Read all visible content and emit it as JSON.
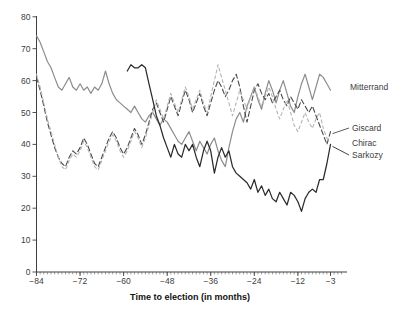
{
  "figure": {
    "background": "#ffffff"
  },
  "chart_data": {
    "type": "line",
    "title": "",
    "xlabel": "Time to election (in months)",
    "ylabel": "",
    "xlim": [
      -84,
      0
    ],
    "ylim": [
      0,
      80
    ],
    "xticks": [
      -84,
      -72,
      -60,
      -48,
      -36,
      -24,
      -12,
      -3
    ],
    "yticks": [
      0,
      10,
      20,
      30,
      40,
      50,
      60,
      70,
      80
    ],
    "minor_xtick_every_months": 1,
    "grid": false,
    "legend_position": "right-end-labels",
    "axis_color": "#3f3f3f",
    "series": [
      {
        "name": "Mitterrand",
        "style": "solid",
        "color": "#8c8c8c",
        "width": 1.2,
        "dash": "",
        "label": {
          "x": 350,
          "y": 90,
          "connector": false
        },
        "points": [
          [
            -84,
            74
          ],
          [
            -83,
            72
          ],
          [
            -82,
            69
          ],
          [
            -81,
            66
          ],
          [
            -80,
            64
          ],
          [
            -79,
            61
          ],
          [
            -78,
            58
          ],
          [
            -77,
            57
          ],
          [
            -76,
            59
          ],
          [
            -75,
            61
          ],
          [
            -74,
            58
          ],
          [
            -73,
            57
          ],
          [
            -72,
            59
          ],
          [
            -71,
            57
          ],
          [
            -70,
            58
          ],
          [
            -69,
            56
          ],
          [
            -68,
            58
          ],
          [
            -67,
            57
          ],
          [
            -66,
            59
          ],
          [
            -65,
            63
          ],
          [
            -64,
            59
          ],
          [
            -63,
            56
          ],
          [
            -62,
            54
          ],
          [
            -61,
            53
          ],
          [
            -60,
            52
          ],
          [
            -59,
            51
          ],
          [
            -58,
            50
          ],
          [
            -57,
            52
          ],
          [
            -56,
            50
          ],
          [
            -55,
            48
          ],
          [
            -54,
            47
          ],
          [
            -53,
            49
          ],
          [
            -52,
            50
          ],
          [
            -51,
            48
          ],
          [
            -50,
            46
          ],
          [
            -49,
            48
          ],
          [
            -48,
            47
          ],
          [
            -47,
            45
          ],
          [
            -46,
            43
          ],
          [
            -45,
            41
          ],
          [
            -44,
            40
          ],
          [
            -43,
            42
          ],
          [
            -42,
            44
          ],
          [
            -41,
            41
          ],
          [
            -40,
            38
          ],
          [
            -39,
            41
          ],
          [
            -38,
            39
          ],
          [
            -37,
            37
          ],
          [
            -36,
            40
          ],
          [
            -35,
            42
          ],
          [
            -34,
            38
          ],
          [
            -33,
            35
          ],
          [
            -32,
            33
          ],
          [
            -31,
            39
          ],
          [
            -30,
            44
          ],
          [
            -29,
            48
          ],
          [
            -28,
            50
          ],
          [
            -27,
            47
          ],
          [
            -26,
            52
          ],
          [
            -25,
            55
          ],
          [
            -24,
            58
          ],
          [
            -23,
            54
          ],
          [
            -22,
            51
          ],
          [
            -21,
            56
          ],
          [
            -20,
            60
          ],
          [
            -19,
            57
          ],
          [
            -18,
            53
          ],
          [
            -17,
            57
          ],
          [
            -16,
            60
          ],
          [
            -15,
            56
          ],
          [
            -14,
            52
          ],
          [
            -13,
            50
          ],
          [
            -12,
            55
          ],
          [
            -11,
            59
          ],
          [
            -10,
            62
          ],
          [
            -9,
            58
          ],
          [
            -8,
            54
          ],
          [
            -7,
            58
          ],
          [
            -6,
            62
          ],
          [
            -5,
            61
          ],
          [
            -4,
            59
          ],
          [
            -3,
            57
          ]
        ]
      },
      {
        "name": "Giscard",
        "style": "dashed",
        "color": "#4a4a4a",
        "width": 1.1,
        "dash": "5 3",
        "label": {
          "x": 352,
          "y": 131,
          "connector": true
        },
        "points": [
          [
            -84,
            61
          ],
          [
            -83,
            57
          ],
          [
            -82,
            52
          ],
          [
            -81,
            47
          ],
          [
            -80,
            43
          ],
          [
            -79,
            39
          ],
          [
            -78,
            36
          ],
          [
            -77,
            34
          ],
          [
            -76,
            33
          ],
          [
            -75,
            36
          ],
          [
            -74,
            38
          ],
          [
            -73,
            37
          ],
          [
            -72,
            39
          ],
          [
            -71,
            42
          ],
          [
            -70,
            40
          ],
          [
            -69,
            37
          ],
          [
            -68,
            34
          ],
          [
            -67,
            33
          ],
          [
            -66,
            36
          ],
          [
            -65,
            39
          ],
          [
            -64,
            42
          ],
          [
            -63,
            44
          ],
          [
            -62,
            42
          ],
          [
            -61,
            39
          ],
          [
            -60,
            37
          ],
          [
            -59,
            39
          ],
          [
            -58,
            42
          ],
          [
            -57,
            45
          ],
          [
            -56,
            43
          ],
          [
            -55,
            40
          ],
          [
            -54,
            43
          ],
          [
            -53,
            47
          ],
          [
            -52,
            51
          ],
          [
            -51,
            53
          ],
          [
            -50,
            50
          ],
          [
            -49,
            47
          ],
          [
            -48,
            51
          ],
          [
            -47,
            55
          ],
          [
            -46,
            52
          ],
          [
            -45,
            49
          ],
          [
            -44,
            53
          ],
          [
            -43,
            57
          ],
          [
            -42,
            54
          ],
          [
            -41,
            50
          ],
          [
            -40,
            53
          ],
          [
            -39,
            56
          ],
          [
            -38,
            52
          ],
          [
            -37,
            49
          ],
          [
            -36,
            53
          ],
          [
            -35,
            57
          ],
          [
            -34,
            60
          ],
          [
            -33,
            58
          ],
          [
            -32,
            55
          ],
          [
            -31,
            57
          ],
          [
            -30,
            60
          ],
          [
            -29,
            62
          ],
          [
            -28,
            58
          ],
          [
            -27,
            52
          ],
          [
            -26,
            47
          ],
          [
            -25,
            52
          ],
          [
            -24,
            57
          ],
          [
            -23,
            59
          ],
          [
            -22,
            56
          ],
          [
            -21,
            54
          ],
          [
            -20,
            56
          ],
          [
            -19,
            53
          ],
          [
            -18,
            55
          ],
          [
            -17,
            57
          ],
          [
            -16,
            54
          ],
          [
            -15,
            52
          ],
          [
            -14,
            55
          ],
          [
            -13,
            53
          ],
          [
            -12,
            51
          ],
          [
            -11,
            54
          ],
          [
            -10,
            52
          ],
          [
            -9,
            50
          ],
          [
            -8,
            52
          ],
          [
            -7,
            49
          ],
          [
            -6,
            46
          ],
          [
            -5,
            43
          ],
          [
            -4,
            40
          ],
          [
            -3,
            44
          ]
        ]
      },
      {
        "name": "Chirac",
        "style": "dashed",
        "color": "#b4b4b4",
        "width": 1.1,
        "dash": "3 3",
        "label": {
          "x": 352,
          "y": 146,
          "connector": false
        },
        "points": [
          [
            -84,
            62
          ],
          [
            -83,
            58
          ],
          [
            -82,
            53
          ],
          [
            -81,
            48
          ],
          [
            -80,
            44
          ],
          [
            -79,
            40
          ],
          [
            -78,
            36
          ],
          [
            -77,
            33
          ],
          [
            -76,
            32
          ],
          [
            -75,
            35
          ],
          [
            -74,
            37
          ],
          [
            -73,
            36
          ],
          [
            -72,
            38
          ],
          [
            -71,
            41
          ],
          [
            -70,
            39
          ],
          [
            -69,
            36
          ],
          [
            -68,
            33
          ],
          [
            -67,
            32
          ],
          [
            -66,
            35
          ],
          [
            -65,
            38
          ],
          [
            -64,
            41
          ],
          [
            -63,
            43
          ],
          [
            -62,
            41
          ],
          [
            -61,
            38
          ],
          [
            -60,
            36
          ],
          [
            -59,
            38
          ],
          [
            -58,
            41
          ],
          [
            -57,
            44
          ],
          [
            -56,
            42
          ],
          [
            -55,
            39
          ],
          [
            -54,
            42
          ],
          [
            -53,
            46
          ],
          [
            -52,
            50
          ],
          [
            -51,
            54
          ],
          [
            -50,
            51
          ],
          [
            -49,
            48
          ],
          [
            -48,
            52
          ],
          [
            -47,
            56
          ],
          [
            -46,
            53
          ],
          [
            -45,
            50
          ],
          [
            -44,
            54
          ],
          [
            -43,
            58
          ],
          [
            -42,
            55
          ],
          [
            -41,
            51
          ],
          [
            -40,
            54
          ],
          [
            -39,
            57
          ],
          [
            -38,
            53
          ],
          [
            -37,
            50
          ],
          [
            -36,
            55
          ],
          [
            -35,
            60
          ],
          [
            -34,
            65
          ],
          [
            -33,
            61
          ],
          [
            -32,
            57
          ],
          [
            -31,
            53
          ],
          [
            -30,
            49
          ],
          [
            -29,
            53
          ],
          [
            -28,
            57
          ],
          [
            -27,
            54
          ],
          [
            -26,
            51
          ],
          [
            -25,
            55
          ],
          [
            -24,
            58
          ],
          [
            -23,
            55
          ],
          [
            -22,
            52
          ],
          [
            -21,
            55
          ],
          [
            -20,
            58
          ],
          [
            -19,
            55
          ],
          [
            -18,
            51
          ],
          [
            -17,
            48
          ],
          [
            -16,
            51
          ],
          [
            -15,
            54
          ],
          [
            -14,
            50
          ],
          [
            -13,
            46
          ],
          [
            -12,
            44
          ],
          [
            -11,
            47
          ],
          [
            -10,
            50
          ],
          [
            -9,
            47
          ],
          [
            -8,
            45
          ],
          [
            -7,
            48
          ],
          [
            -6,
            50
          ],
          [
            -5,
            45
          ],
          [
            -4,
            42
          ],
          [
            -3,
            41
          ]
        ]
      },
      {
        "name": "Sarkozy",
        "style": "solid",
        "color": "#2b2b2b",
        "width": 1.25,
        "dash": "",
        "label": {
          "x": 352,
          "y": 158,
          "connector": true
        },
        "points": [
          [
            -59,
            63
          ],
          [
            -58,
            65
          ],
          [
            -57,
            64
          ],
          [
            -56,
            64
          ],
          [
            -55,
            65
          ],
          [
            -54,
            64
          ],
          [
            -53,
            59
          ],
          [
            -52,
            54
          ],
          [
            -51,
            49
          ],
          [
            -50,
            46
          ],
          [
            -49,
            42
          ],
          [
            -48,
            39
          ],
          [
            -47,
            36
          ],
          [
            -46,
            40
          ],
          [
            -45,
            37
          ],
          [
            -44,
            36
          ],
          [
            -43,
            40
          ],
          [
            -42,
            38
          ],
          [
            -41,
            40
          ],
          [
            -40,
            36
          ],
          [
            -39,
            33
          ],
          [
            -38,
            38
          ],
          [
            -37,
            41
          ],
          [
            -36,
            38
          ],
          [
            -35,
            31
          ],
          [
            -34,
            36
          ],
          [
            -33,
            39
          ],
          [
            -32,
            36
          ],
          [
            -31,
            38
          ],
          [
            -30,
            33
          ],
          [
            -29,
            31
          ],
          [
            -28,
            30
          ],
          [
            -27,
            29
          ],
          [
            -26,
            28
          ],
          [
            -25,
            26
          ],
          [
            -24,
            29
          ],
          [
            -23,
            25
          ],
          [
            -22,
            27
          ],
          [
            -21,
            24
          ],
          [
            -20,
            26
          ],
          [
            -19,
            23
          ],
          [
            -18,
            22
          ],
          [
            -17,
            25
          ],
          [
            -16,
            23
          ],
          [
            -15,
            21
          ],
          [
            -14,
            25
          ],
          [
            -13,
            24
          ],
          [
            -12,
            22
          ],
          [
            -11,
            19
          ],
          [
            -10,
            23
          ],
          [
            -9,
            25
          ],
          [
            -8,
            26
          ],
          [
            -7,
            25
          ],
          [
            -6,
            29
          ],
          [
            -5,
            29
          ],
          [
            -4,
            34
          ],
          [
            -3,
            40
          ]
        ]
      }
    ],
    "layout_hints": {
      "plot_left_x": 36.5,
      "x_axis_y": 272,
      "x_axis_right": 347,
      "y_axis_top": 16,
      "px_per_month": 3.63,
      "px_per_unit": 3.19,
      "major_tick_len": 4,
      "minor_tick_len": 2.4,
      "xlabel_x": 190,
      "xlabel_y": 300
    }
  }
}
